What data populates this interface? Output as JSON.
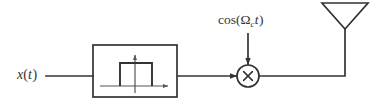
{
  "diagram": {
    "type": "block-diagram",
    "background_color": "#ffffff",
    "line_color": "#333333",
    "text_color": "#333333",
    "nodes": [
      {
        "id": "input-signal",
        "name": "input-signal-label",
        "label": "x(t)",
        "label_parts": {
          "func": "x",
          "open": "(",
          "arg": "t",
          "close": ")"
        },
        "x": 17,
        "y": 68
      },
      {
        "id": "filter-block",
        "name": "filter-block",
        "label": "",
        "shape": "rectangle",
        "contents": "lowpass rectangular spectrum plot",
        "x": 93,
        "y": 45,
        "width": 84,
        "height": 52
      },
      {
        "id": "carrier-source",
        "name": "carrier-label",
        "label": "cos(Ωc t)",
        "label_parts": {
          "func": "cos",
          "open": "(",
          "omega": "Ω",
          "subscript": "c",
          "var": "t",
          "close": ")"
        },
        "x": 218,
        "y": 13
      },
      {
        "id": "multiplier",
        "name": "multiplier-node",
        "label": "×",
        "shape": "circle",
        "cx": 248,
        "cy": 76,
        "r": 11
      },
      {
        "id": "antenna",
        "name": "antenna",
        "label": "",
        "shape": "inverted-triangle",
        "apex_x": 345,
        "apex_y": 29,
        "top_left_x": 322,
        "top_right_x": 368,
        "top_y": 3
      }
    ],
    "edges": [
      {
        "name": "edge-input-to-filter",
        "from": "input-signal",
        "to": "filter-block",
        "arrow": false
      },
      {
        "name": "edge-filter-to-multiplier",
        "from": "filter-block",
        "to": "multiplier",
        "arrow": true
      },
      {
        "name": "edge-carrier-to-multiplier",
        "from": "carrier-source",
        "to": "multiplier",
        "arrow": true
      },
      {
        "name": "edge-multiplier-to-antenna",
        "from": "multiplier",
        "to": "antenna",
        "arrow": false
      }
    ],
    "filter_plot": {
      "name": "filter-response-plot",
      "description": "rectangular (ideal lowpass) magnitude response",
      "axis_h_y": 86,
      "axis_h_x0": 100,
      "axis_h_x1": 171,
      "axis_v_x": 135,
      "axis_v_y_top": 53,
      "pulse_left": 120,
      "pulse_right": 152,
      "pulse_top": 63
    }
  }
}
